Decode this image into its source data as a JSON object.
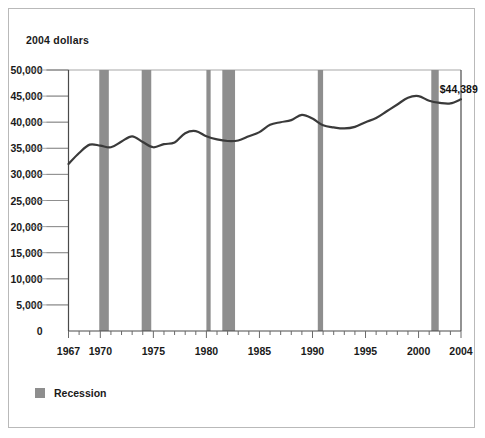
{
  "chart_data": {
    "type": "line",
    "title": "",
    "ylabel": "2004 dollars",
    "xlabel": "",
    "ylim": [
      0,
      50000
    ],
    "xlim": [
      1967,
      2004
    ],
    "grid": true,
    "legend_position": "bottom-left",
    "y_ticks": [
      0,
      5000,
      10000,
      15000,
      20000,
      25000,
      30000,
      35000,
      40000,
      45000,
      50000
    ],
    "y_ticklabels": [
      "0",
      "5,000",
      "10,000",
      "15,000",
      "20,000",
      "25,000",
      "30,000",
      "35,000",
      "40,000",
      "45,000",
      "50,000"
    ],
    "x_ticklabels": [
      "1967",
      "1970",
      "1975",
      "1980",
      "1985",
      "1990",
      "1995",
      "2000",
      "2004"
    ],
    "x_ticklabel_years": [
      1967,
      1970,
      1975,
      1980,
      1985,
      1990,
      1995,
      2000,
      2004
    ],
    "x_minor_tick_interval": 1,
    "series": [
      {
        "name": "Median household income",
        "color": "#3a3a3a",
        "x": [
          1967,
          1968,
          1969,
          1970,
          1971,
          1972,
          1973,
          1974,
          1975,
          1976,
          1977,
          1978,
          1979,
          1980,
          1981,
          1982,
          1983,
          1984,
          1985,
          1986,
          1987,
          1988,
          1989,
          1990,
          1991,
          1992,
          1993,
          1994,
          1995,
          1996,
          1997,
          1998,
          1999,
          2000,
          2001,
          2002,
          2003,
          2004
        ],
        "values": [
          32000,
          34100,
          35700,
          35500,
          35200,
          36300,
          37300,
          36200,
          35200,
          35800,
          36100,
          37900,
          38300,
          37300,
          36700,
          36400,
          36500,
          37300,
          38100,
          39500,
          40000,
          40400,
          41400,
          40700,
          39400,
          39000,
          38800,
          39100,
          40000,
          40800,
          42100,
          43400,
          44700,
          45000,
          44100,
          43700,
          43600,
          44389
        ]
      }
    ],
    "recessions": [
      {
        "label": "1969-1970",
        "start": 1969.9,
        "end": 1970.8
      },
      {
        "label": "1973-1975",
        "start": 1973.9,
        "end": 1974.8
      },
      {
        "label": "1980",
        "start": 1980.0,
        "end": 1980.4
      },
      {
        "label": "1981-1982",
        "start": 1981.5,
        "end": 1982.7
      },
      {
        "label": "1990-1991",
        "start": 1990.5,
        "end": 1991.0
      },
      {
        "label": "2001",
        "start": 2001.2,
        "end": 2001.9
      }
    ],
    "recession_color": "#8e8e8e",
    "annotations": [
      {
        "name": "endpoint-value",
        "text": "$44,389",
        "x": 2002.0,
        "y": 45600
      }
    ]
  },
  "legend": {
    "items": [
      {
        "label": "Recession",
        "color": "#8e8e8e"
      }
    ]
  },
  "annotation_label": "$44,389",
  "axis_title": "2004 dollars"
}
